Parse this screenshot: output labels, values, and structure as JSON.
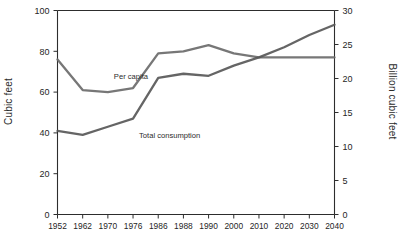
{
  "chart_data": {
    "type": "line",
    "title": "",
    "subtitle": "",
    "xlabel": "",
    "ylabel": "Cubic feet",
    "ylabel_right": "Billion cubic feet",
    "grid": false,
    "legend_position": "inline-annotations",
    "categories": [
      "1952",
      "1962",
      "1970",
      "1976",
      "1986",
      "1988",
      "1990",
      "2000",
      "2010",
      "2020",
      "2030",
      "2040"
    ],
    "ylim": [
      0,
      100
    ],
    "yticks": [
      0,
      20,
      40,
      60,
      80,
      100
    ],
    "ylim_right": [
      0,
      30
    ],
    "yticks_right": [
      0,
      5,
      10,
      15,
      20,
      25,
      30
    ],
    "series": [
      {
        "name": "Per capita",
        "axis": "left",
        "color": "#6b6b6b",
        "values": [
          76,
          61,
          60,
          62,
          79,
          80,
          83,
          79,
          77,
          77,
          77,
          77
        ]
      },
      {
        "name": "Total consumption",
        "axis": "left",
        "color": "#585858",
        "values": [
          41,
          39,
          43,
          47,
          67,
          69,
          68,
          73,
          77,
          82,
          88,
          93
        ]
      }
    ],
    "annotations": [
      {
        "text": "Per capita",
        "x_index": 2,
        "y_value": 68
      },
      {
        "text": "Total consumption",
        "x_index": 3,
        "y_value": 39
      }
    ]
  },
  "axes": {
    "left_title": "Cubic feet",
    "right_title": "Billion cubic feet",
    "left_ticks": [
      "100",
      "80",
      "60",
      "40",
      "20",
      "0"
    ],
    "right_ticks": [
      "30",
      "25",
      "20",
      "15",
      "10",
      "5",
      "0"
    ],
    "x_ticks": [
      "1952",
      "1962",
      "1970",
      "1976",
      "1986",
      "1988",
      "1990",
      "2000",
      "2010",
      "2020",
      "2030",
      "2040"
    ]
  },
  "labels": {
    "per_capita": "Per capita",
    "total_consumption": "Total consumption"
  },
  "caption": ""
}
